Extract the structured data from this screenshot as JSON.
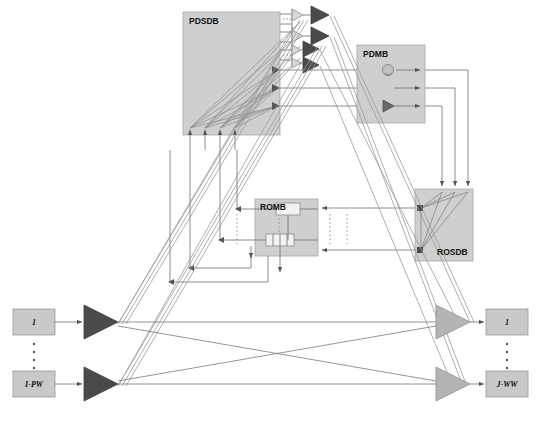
{
  "diagram": {
    "background": "#ffffff",
    "colors": {
      "block_fill": "#cfcfcf",
      "block_stroke": "#9a9a9a",
      "dark_triangle": "#4a4a4a",
      "light_triangle": "#b4b4b4",
      "line": "#6e6e6e",
      "inner_box": "#f2f2f2",
      "text": "#111111"
    },
    "blocks": [
      {
        "id": "pdsdb",
        "label": "PDSDB",
        "x": 183,
        "y": 12,
        "w": 97,
        "h": 123,
        "label_pos": "top-left"
      },
      {
        "id": "pdmb",
        "label": "PDMB",
        "x": 357,
        "y": 45,
        "w": 68,
        "h": 78,
        "label_pos": "top-left"
      },
      {
        "id": "romb",
        "label": "ROMB",
        "x": 255,
        "y": 199,
        "w": 63,
        "h": 57,
        "label_pos": "top-left"
      },
      {
        "id": "rosdb",
        "label": "ROSDB",
        "x": 415,
        "y": 189,
        "w": 58,
        "h": 72,
        "label_pos": "bottom-right"
      }
    ],
    "io_ports": {
      "inputs": [
        {
          "label": "1",
          "x": 13,
          "y": 309,
          "w": 42,
          "h": 26
        },
        {
          "label": "I-PW",
          "x": 13,
          "y": 371,
          "w": 42,
          "h": 26
        }
      ],
      "outputs": [
        {
          "label": "1",
          "x": 486,
          "y": 309,
          "w": 42,
          "h": 26
        },
        {
          "label": "J-WW",
          "x": 486,
          "y": 371,
          "w": 42,
          "h": 26
        }
      ],
      "vertical_ellipsis_dots": 5
    },
    "amplifiers": {
      "input_side_count": 2,
      "output_side_count": 2,
      "top_stage_light_count": 4,
      "top_stage_dark_count": 4,
      "pdmb_internal_count": 1
    },
    "pdsdb_internal": {
      "input_arrows": 4,
      "output_taps": 3
    },
    "rosdb_internal": {
      "input_arrows": 3,
      "fan_nodes": 2
    },
    "romb_internal": {
      "modules": 2,
      "segmented_module_cells": 4
    },
    "dotted_columns": 4
  }
}
